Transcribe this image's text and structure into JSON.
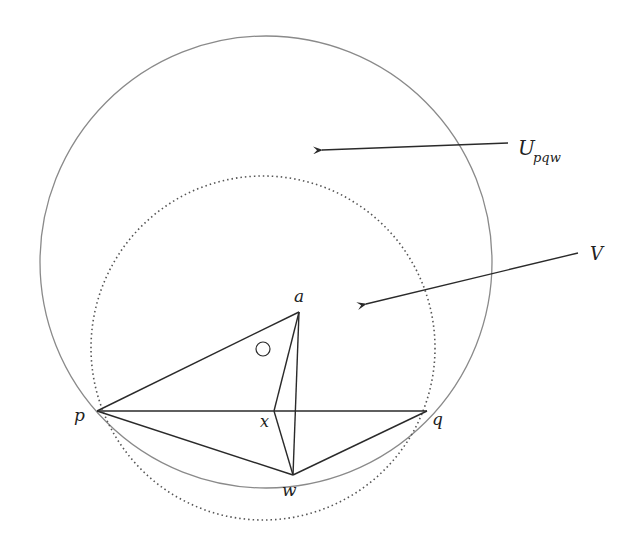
{
  "diagram": {
    "type": "geometric-figure",
    "labels": {
      "U": "U",
      "U_sub": "pqw",
      "V": "V",
      "a": "a",
      "p": "p",
      "q": "q",
      "x": "x",
      "w": "w"
    },
    "colors": {
      "circle_U": "#8a8a8a",
      "circle_V": "#555555",
      "lines": "#2a2a2a",
      "text": "#222222"
    },
    "points": {
      "a": [
        299,
        312
      ],
      "p": [
        97,
        411
      ],
      "q": [
        427,
        411
      ],
      "x": [
        274,
        411
      ],
      "w": [
        293,
        475
      ]
    },
    "circles": {
      "U": {
        "cx": 266,
        "cy": 262,
        "r": 226,
        "style": "solid"
      },
      "V": {
        "cx": 263,
        "cy": 348,
        "r": 172,
        "style": "dotted"
      }
    },
    "arrows": [
      {
        "name": "U-pointer",
        "from": [
          508,
          143
        ],
        "to": [
          318,
          151
        ]
      },
      {
        "name": "V-pointer",
        "from": [
          578,
          253
        ],
        "to": [
          362,
          305
        ]
      }
    ],
    "small_circle": {
      "cx": 263,
      "cy": 349,
      "r": 7
    }
  }
}
